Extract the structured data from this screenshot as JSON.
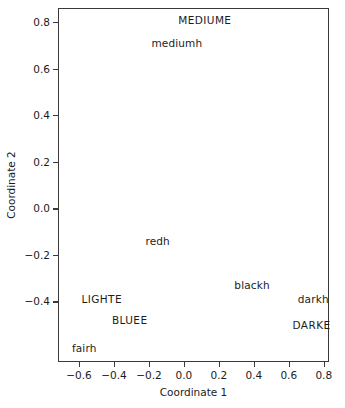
{
  "chart_data": {
    "type": "scatter",
    "title": "",
    "xlabel": "Coordinate 1",
    "ylabel": "Coordinate 2",
    "xlim": [
      -0.72,
      0.83
    ],
    "ylim": [
      -0.66,
      0.86
    ],
    "xticks": [
      -0.6,
      -0.4,
      -0.2,
      0.0,
      0.2,
      0.4,
      0.6,
      0.8
    ],
    "xticklabels": [
      "−0.6",
      "−0.4",
      "−0.2",
      "0.0",
      "0.2",
      "0.4",
      "0.6",
      "0.8"
    ],
    "yticks": [
      0.8,
      0.6,
      0.4,
      0.2,
      0.0,
      -0.2,
      -0.4
    ],
    "yticklabels": [
      "0.8",
      "0.6",
      "0.4",
      "0.2",
      "0.0",
      "−0.2",
      "−0.4"
    ],
    "grid": false,
    "legend": false,
    "marker": "text-label-only",
    "points": [
      {
        "label": "MEDIUME",
        "x": 0.12,
        "y": 0.81,
        "style": "upper"
      },
      {
        "label": "mediumh",
        "x": -0.04,
        "y": 0.71,
        "style": "lower"
      },
      {
        "label": "redh",
        "x": -0.15,
        "y": -0.14,
        "style": "lower"
      },
      {
        "label": "blackh",
        "x": 0.39,
        "y": -0.33,
        "style": "lower"
      },
      {
        "label": "darkh",
        "x": 0.74,
        "y": -0.39,
        "style": "lower"
      },
      {
        "label": "DARKE",
        "x": 0.73,
        "y": -0.5,
        "style": "upper"
      },
      {
        "label": "LIGHTE",
        "x": -0.47,
        "y": -0.39,
        "style": "upper"
      },
      {
        "label": "BLUEE",
        "x": -0.31,
        "y": -0.48,
        "style": "upper"
      },
      {
        "label": "fairh",
        "x": -0.57,
        "y": -0.6,
        "style": "lower"
      }
    ]
  },
  "axes": {
    "x_title": "Coordinate 1",
    "y_title": "Coordinate 2"
  },
  "colors": {
    "frame": "#3a3a3a",
    "text": "#1c1c1c",
    "background": "#ffffff"
  }
}
